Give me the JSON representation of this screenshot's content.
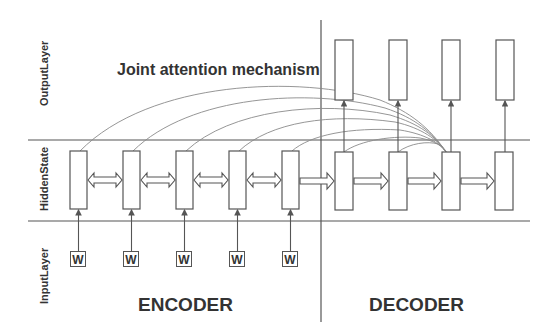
{
  "title": "Joint attention mechanism",
  "layers": {
    "output": "OutputLayer",
    "hidden": "HiddenState",
    "input": "InputLayer"
  },
  "sections": {
    "encoder": "ENCODER",
    "decoder": "DECODER"
  },
  "encoder": {
    "cell_count": 5,
    "input_tokens": [
      "W",
      "W",
      "W",
      "W",
      "W"
    ],
    "connection": "bidirectional"
  },
  "decoder": {
    "cell_count": 4,
    "output_count": 4,
    "connection": "forward"
  },
  "attention": {
    "target": "decoder cell 3",
    "sources": [
      "encoder cell 1",
      "encoder cell 2",
      "encoder cell 3",
      "encoder cell 4",
      "encoder cell 5",
      "decoder cell 1",
      "decoder cell 2"
    ]
  },
  "colors": {
    "stroke": "#555555",
    "curve": "#8a8a8a",
    "text": "#333333",
    "background": "#ffffff"
  }
}
